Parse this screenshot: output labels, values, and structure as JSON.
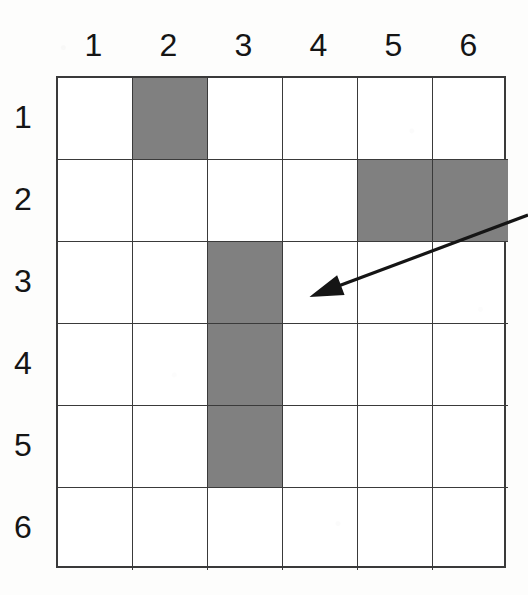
{
  "figure": {
    "background_color": "#fdfdfc",
    "grid_line_color": "#3a3a3a",
    "fill_color": "#808080",
    "label_color": "#151515"
  },
  "column_headers": [
    {
      "label": "1"
    },
    {
      "label": "2"
    },
    {
      "label": "3"
    },
    {
      "label": "4"
    },
    {
      "label": "5"
    },
    {
      "label": "6"
    }
  ],
  "row_headers": [
    {
      "label": "1"
    },
    {
      "label": "2"
    },
    {
      "label": "3"
    },
    {
      "label": "4"
    },
    {
      "label": "5"
    },
    {
      "label": "6"
    }
  ],
  "chart_data": {
    "type": "heatmap",
    "title": "",
    "xlabel": "",
    "ylabel": "",
    "categories": [
      "1",
      "2",
      "3",
      "4",
      "5",
      "6"
    ],
    "row_categories": [
      "1",
      "2",
      "3",
      "4",
      "5",
      "6"
    ],
    "grid": true,
    "legend": "none",
    "value_meaning": {
      "0": "unshaded",
      "1": "shaded"
    },
    "values": [
      [
        0,
        1,
        0,
        0,
        0,
        0
      ],
      [
        0,
        0,
        0,
        0,
        1,
        1
      ],
      [
        0,
        0,
        1,
        0,
        0,
        0
      ],
      [
        0,
        0,
        1,
        0,
        0,
        0
      ],
      [
        0,
        0,
        1,
        0,
        0,
        0
      ],
      [
        0,
        0,
        0,
        0,
        0,
        0
      ]
    ],
    "shaded_cells": [
      {
        "row": 1,
        "col": 2
      },
      {
        "row": 2,
        "col": 5
      },
      {
        "row": 2,
        "col": 6
      },
      {
        "row": 3,
        "col": 3
      },
      {
        "row": 4,
        "col": 3
      },
      {
        "row": 5,
        "col": 3
      }
    ],
    "shaded_count": 6,
    "total_cells": 36
  },
  "annotation": {
    "arrow": {
      "points_to_row": "3",
      "points_to_col": "4",
      "tail_x": 528,
      "tail_y": 215,
      "tip_x": 312,
      "tip_y": 296,
      "color": "#151515"
    }
  }
}
